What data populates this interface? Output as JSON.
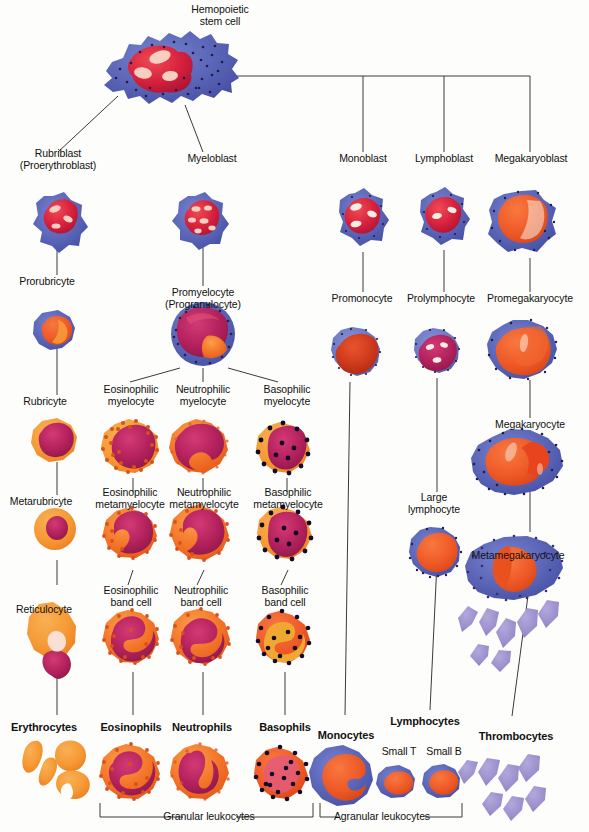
{
  "diagram": {
    "background": "#fdfdfb",
    "line_color": "#3a3a3a"
  },
  "palette": {
    "cyto_blue": "#5661b4",
    "cyto_blue_dark": "#4450a6",
    "cyto_blue_light": "#7b85c9",
    "nucleus_red": "#d6213c",
    "nucleus_crimson": "#b3215c",
    "nucleus_magenta": "#bf1f55",
    "cyto_orange": "#f59a35",
    "cyto_orange_deep": "#f4762a",
    "granule_orange": "#e2561f",
    "granule_black": "#1a1333",
    "platelet_purple": "#9b8ecb",
    "red_orange": "#ef5a28",
    "highlight": "#f7cfc0",
    "erythro_orange": "#f79038"
  },
  "labels": {
    "stem_cell": "Hemopoietic\nstem cell",
    "rubriblast": "Rubriblast\n(Proerythroblast)",
    "myeloblast": "Myeloblast",
    "monoblast": "Monoblast",
    "lymphoblast": "Lymphoblast",
    "megakaryoblast": "Megakaryoblast",
    "prorubricyte": "Prorubricyte",
    "promyelocyte": "Promyelocyte\n(Progranulocyte)",
    "promonocyte": "Promonocyte",
    "prolymphocyte": "Prolymphocyte",
    "promegakaryocyte": "Promegakaryocyte",
    "rubricyte": "Rubricyte",
    "eos_myelocyte": "Eosinophilic\nmyelocyte",
    "neu_myelocyte": "Neutrophilic\nmyelocyte",
    "bas_myelocyte": "Basophilic\nmyelocyte",
    "megakaryocyte": "Megakaryocyte",
    "metarubricyte": "Metarubricyte",
    "eos_metamyelocyte": "Eosinophilic\nmetamyelocyte",
    "neu_metamyelocyte": "Neutrophilic\nmetamyelocyte",
    "bas_metamyelocyte": "Basophilic\nmetamyelocyte",
    "large_lymphocyte": "Large\nlymphocyte",
    "metamegakaryocyte": "Metamegakaryocyte",
    "reticulocyte": "Reticulocyte",
    "eos_band": "Eosinophilic\nband cell",
    "neu_band": "Neutrophilic\nband cell",
    "bas_band": "Basophilic\nband cell",
    "erythrocytes": "Erythrocytes",
    "eosinophils": "Eosinophils",
    "neutrophils": "Neutrophils",
    "basophils": "Basophils",
    "monocytes": "Monocytes",
    "lymphocytes": "Lymphocytes",
    "thrombocytes": "Thrombocytes",
    "small_t": "Small T",
    "small_b": "Small B",
    "granular_leukocytes": "Granular leukocytes",
    "agranular_leukocytes": "Agranular leukocytes"
  },
  "lineages": [
    {
      "name": "erythrocyte",
      "stages": [
        "Rubriblast (Proerythroblast)",
        "Prorubricyte",
        "Rubricyte",
        "Metarubricyte",
        "Reticulocyte",
        "Erythrocytes"
      ]
    },
    {
      "name": "granulocyte",
      "stages": [
        "Myeloblast",
        "Promyelocyte (Progranulocyte)",
        "Myelocyte",
        "Metamyelocyte",
        "Band cell",
        "Granulocyte"
      ],
      "branches": [
        "Eosinophilic",
        "Neutrophilic",
        "Basophilic"
      ]
    },
    {
      "name": "monocyte",
      "stages": [
        "Monoblast",
        "Promonocyte",
        "Monocytes"
      ]
    },
    {
      "name": "lymphocyte",
      "stages": [
        "Lymphoblast",
        "Prolymphocyte",
        "Large lymphocyte",
        "Lymphocytes",
        "Small T",
        "Small B"
      ]
    },
    {
      "name": "thrombocyte",
      "stages": [
        "Megakaryoblast",
        "Promegakaryocyte",
        "Megakaryocyte",
        "Metamegakaryocyte",
        "Thrombocytes"
      ]
    }
  ],
  "groupings": [
    {
      "label": "Granular leukocytes",
      "members": [
        "Eosinophils",
        "Neutrophils",
        "Basophils"
      ]
    },
    {
      "label": "Agranular leukocytes",
      "members": [
        "Monocytes",
        "Lymphocytes"
      ]
    }
  ]
}
